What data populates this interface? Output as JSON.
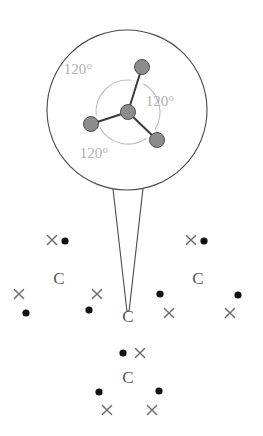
{
  "figure": {
    "colors": {
      "background": "#ffffff",
      "callout_outline": "#4a4a4a",
      "atom_fill": "#8c8c8c",
      "atom_stroke": "#4f4f4f",
      "bond": "#3a3a3a",
      "arc": "#bdbdbd",
      "angle_label": "#b0b0b0",
      "lattice_dot": "#111111",
      "lattice_cross": "#6b6b6b",
      "lattice_letter": "#555555"
    },
    "callout": {
      "circle": {
        "cx": 127,
        "cy": 110,
        "r": 80
      },
      "tail": {
        "left_x": 113,
        "right_x": 143,
        "top_y": 188,
        "tip_x": 128,
        "tip_y": 311
      }
    },
    "molecule": {
      "center_atom": {
        "name": "central-atom",
        "cx": 128,
        "cy": 112,
        "r": 7.5
      },
      "outer_atoms": [
        {
          "name": "atom-top",
          "cx": 142,
          "cy": 67,
          "r": 7.5
        },
        {
          "name": "atom-left",
          "cx": 91,
          "cy": 124,
          "r": 7.5
        },
        {
          "name": "atom-lower-right",
          "cx": 157,
          "cy": 140,
          "r": 7.5
        }
      ],
      "angle_arc_radius": 32,
      "angle_labels": [
        {
          "name": "angle-label-upper-left",
          "text": "120°",
          "x": 78,
          "y": 74
        },
        {
          "name": "angle-label-right",
          "text": "120°",
          "x": 160,
          "y": 106
        },
        {
          "name": "angle-label-bottom",
          "text": "120°",
          "x": 94,
          "y": 158
        }
      ]
    },
    "lattice": {
      "letters": [
        {
          "name": "lattice-carbon-top-left",
          "text": "C",
          "x": 59,
          "y": 284
        },
        {
          "name": "lattice-carbon-top-right",
          "text": "C",
          "x": 198,
          "y": 284
        },
        {
          "name": "lattice-carbon-center",
          "text": "C",
          "x": 128,
          "y": 322
        },
        {
          "name": "lattice-carbon-bottom",
          "text": "C",
          "x": 128,
          "y": 383
        }
      ],
      "dots": [
        {
          "name": "electron-dot",
          "cx": 65,
          "cy": 241,
          "r": 3.6
        },
        {
          "name": "electron-dot",
          "cx": 26,
          "cy": 313,
          "r": 3.6
        },
        {
          "name": "electron-dot",
          "cx": 89,
          "cy": 310,
          "r": 3.6
        },
        {
          "name": "electron-dot",
          "cx": 204,
          "cy": 241,
          "r": 3.6
        },
        {
          "name": "electron-dot",
          "cx": 160,
          "cy": 294,
          "r": 3.6
        },
        {
          "name": "electron-dot",
          "cx": 238,
          "cy": 295,
          "r": 3.6
        },
        {
          "name": "electron-dot",
          "cx": 123,
          "cy": 353,
          "r": 3.6
        },
        {
          "name": "electron-dot",
          "cx": 99,
          "cy": 392,
          "r": 3.6
        },
        {
          "name": "electron-dot",
          "cx": 159,
          "cy": 391,
          "r": 3.6
        }
      ],
      "crosses": [
        {
          "name": "electron-cross",
          "cx": 52,
          "cy": 240,
          "s": 4.6
        },
        {
          "name": "electron-cross",
          "cx": 19,
          "cy": 294,
          "s": 4.6
        },
        {
          "name": "electron-cross",
          "cx": 97,
          "cy": 294,
          "s": 4.6
        },
        {
          "name": "electron-cross",
          "cx": 191,
          "cy": 240,
          "s": 4.6
        },
        {
          "name": "electron-cross",
          "cx": 169,
          "cy": 313,
          "s": 4.6
        },
        {
          "name": "electron-cross",
          "cx": 230,
          "cy": 313,
          "s": 4.6
        },
        {
          "name": "electron-cross",
          "cx": 140,
          "cy": 353,
          "s": 4.6
        },
        {
          "name": "electron-cross",
          "cx": 107,
          "cy": 410,
          "s": 4.6
        },
        {
          "name": "electron-cross",
          "cx": 152,
          "cy": 410,
          "s": 4.6
        }
      ]
    }
  }
}
